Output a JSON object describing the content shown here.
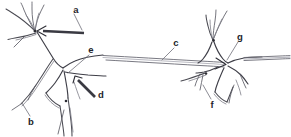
{
  "figure": {
    "background_color": "#ffffff",
    "ink_color": "#4a4a52",
    "label_color": "#24242a",
    "width": 291,
    "height": 137
  },
  "labels": [
    {
      "id": "a",
      "text": "a",
      "x": 76,
      "y": 10,
      "points_to": "dendritic-branch-point-left-neuron",
      "pointer_style": "thick-arrow"
    },
    {
      "id": "b",
      "text": "b",
      "x": 31,
      "y": 122,
      "points_to": "dendrite-lower-left-left-neuron",
      "pointer_style": "thin-leader"
    },
    {
      "id": "c",
      "text": "c",
      "x": 176,
      "y": 43,
      "points_to": "axon",
      "pointer_style": "thin-leader"
    },
    {
      "id": "d",
      "text": "d",
      "x": 101,
      "y": 95,
      "points_to": "axon-hillock-left-neuron",
      "pointer_style": "thick-arrow"
    },
    {
      "id": "e",
      "text": "e",
      "x": 91,
      "y": 50,
      "points_to": "soma-left-neuron",
      "pointer_style": "thin-leader"
    },
    {
      "id": "f",
      "text": "f",
      "x": 212,
      "y": 105,
      "points_to": "dendrite-lower-left-right-neuron",
      "pointer_style": "thin-leader"
    },
    {
      "id": "g",
      "text": "g",
      "x": 240,
      "y": 37,
      "points_to": "soma-right-neuron",
      "pointer_style": "thin-leader"
    }
  ],
  "structures": [
    {
      "name": "left-neuron",
      "role": "presynaptic-cell"
    },
    {
      "name": "right-neuron",
      "role": "postsynaptic-cell"
    },
    {
      "name": "axon",
      "role": "connecting-fiber"
    }
  ]
}
